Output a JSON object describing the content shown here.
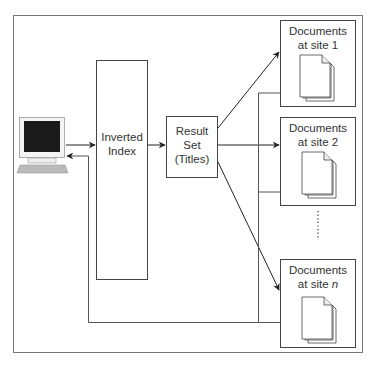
{
  "diagram": {
    "type": "distributed-search-architecture",
    "nodes": {
      "client": {
        "label": "",
        "icon": "computer-terminal-icon"
      },
      "inverted_index": {
        "line1": "Inverted",
        "line2": "Index"
      },
      "result_set": {
        "line1": "Result",
        "line2": "Set",
        "line3": "(Titles)"
      },
      "sites": [
        {
          "line1": "Documents",
          "line2_prefix": "at site ",
          "line2_suffix": "1",
          "icon": "document-stack-icon"
        },
        {
          "line1": "Documents",
          "line2_prefix": "at site ",
          "line2_suffix": "2",
          "icon": "document-stack-icon"
        },
        {
          "line1": "Documents",
          "line2_prefix": "at site ",
          "line2_suffix": "n",
          "icon": "document-stack-icon"
        }
      ],
      "ellipsis": "vertical-dotted-continuation"
    },
    "edges": [
      {
        "from": "client",
        "to": "inverted_index",
        "arrow": "forward"
      },
      {
        "from": "inverted_index",
        "to": "result_set",
        "arrow": "forward"
      },
      {
        "from": "result_set",
        "to": "site_1",
        "arrow": "forward"
      },
      {
        "from": "result_set",
        "to": "site_2",
        "arrow": "forward"
      },
      {
        "from": "result_set",
        "to": "site_n",
        "arrow": "forward"
      },
      {
        "from": "sites_collector",
        "to": "client",
        "arrow": "return"
      },
      {
        "from": "inverted_index",
        "to": "client",
        "arrow": "return-loop"
      }
    ],
    "colors": {
      "line": "#555555",
      "box_border": "#444444",
      "screen": "#111111",
      "keyboard": "#bbbbbb"
    }
  }
}
